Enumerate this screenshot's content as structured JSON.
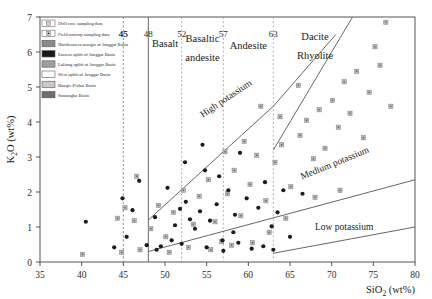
{
  "chart_data": {
    "type": "scatter",
    "title": "",
    "xlabel": "SiO2 (wt%)",
    "xlabel_main": "SiO",
    "xlabel_sub": "2",
    "xlabel_unit": " (wt%)",
    "ylabel": "K2O (wt%)",
    "ylabel_main": "K",
    "ylabel_sub": "2",
    "ylabel_main2": "O (wt%)",
    "xlim": [
      35,
      80
    ],
    "ylim": [
      0,
      7
    ],
    "xticks": [
      35,
      40,
      45,
      50,
      55,
      60,
      65,
      70,
      75,
      80
    ],
    "yticks": [
      0,
      1,
      2,
      3,
      4,
      5,
      6,
      7
    ],
    "grid": false,
    "legend_position": "top-left",
    "rock_boundaries": [
      45,
      48,
      52,
      57,
      63
    ],
    "rock_fields": [
      {
        "label": "Basalt",
        "x": 50.0,
        "y": 6.15
      },
      {
        "label": "Basaltic",
        "x": 54.5,
        "y": 6.3
      },
      {
        "label": "andesite",
        "x": 54.5,
        "y": 5.75
      },
      {
        "label": "Andesite",
        "x": 60.0,
        "y": 6.1
      },
      {
        "label": "Dacite",
        "x": 68.0,
        "y": 6.35
      },
      {
        "label": "Rhyolite",
        "x": 68.0,
        "y": 5.8
      }
    ],
    "series_labels": [
      {
        "label": "High potassium",
        "x": 57.5,
        "y": 4.6,
        "rotate": -34
      },
      {
        "label": "Medium potassium",
        "x": 70.5,
        "y": 2.75,
        "rotate": -22
      },
      {
        "label": "Low potassium",
        "x": 71.5,
        "y": 0.92,
        "rotate": 0
      }
    ],
    "boundary_lines": [
      {
        "name": "high-k-line",
        "points": [
          [
            48,
            1.2
          ],
          [
            63,
            4.45
          ],
          [
            70.5,
            6.5
          ]
        ]
      },
      {
        "name": "medium-k-line",
        "points": [
          [
            48,
            0.3
          ],
          [
            80,
            2.35
          ]
        ]
      },
      {
        "name": "low-k-line",
        "points": [
          [
            63,
            0.25
          ],
          [
            80,
            1.0
          ]
        ]
      },
      {
        "name": "dacite-rhyolite-div",
        "points": [
          [
            63,
            3.2
          ],
          [
            72.5,
            7.0
          ]
        ]
      },
      {
        "name": "left-field-edge",
        "points": [
          [
            48,
            0
          ],
          [
            48,
            7
          ]
        ]
      }
    ],
    "series": [
      {
        "name": "Drill core sampling data",
        "marker": "square-open-dot",
        "points": [
          [
            40.1,
            0.22
          ],
          [
            44.8,
            0.28
          ],
          [
            44.3,
            1.25
          ],
          [
            45.2,
            1.55
          ],
          [
            46.3,
            1.18
          ],
          [
            46.6,
            2.45
          ],
          [
            47.0,
            0.35
          ],
          [
            48.3,
            0.95
          ],
          [
            49.2,
            1.62
          ],
          [
            50.1,
            0.72
          ],
          [
            51.0,
            1.42
          ],
          [
            52.2,
            2.05
          ],
          [
            53.4,
            1.08
          ],
          [
            54.1,
            1.88
          ],
          [
            55.2,
            2.35
          ],
          [
            56.0,
            1.15
          ],
          [
            56.8,
            0.58
          ],
          [
            57.5,
            1.95
          ],
          [
            58.3,
            2.62
          ],
          [
            59.1,
            1.32
          ],
          [
            60.2,
            2.22
          ],
          [
            61.0,
            3.05
          ],
          [
            62.1,
            1.75
          ],
          [
            63.2,
            2.85
          ],
          [
            64.0,
            3.35
          ],
          [
            65.1,
            2.15
          ],
          [
            66.2,
            3.62
          ],
          [
            67.0,
            4.05
          ],
          [
            67.8,
            2.95
          ],
          [
            68.5,
            4.35
          ],
          [
            69.2,
            3.25
          ],
          [
            70.1,
            4.62
          ],
          [
            70.8,
            3.85
          ],
          [
            71.5,
            5.15
          ],
          [
            72.2,
            4.25
          ],
          [
            73.0,
            5.45
          ],
          [
            73.8,
            3.55
          ],
          [
            74.5,
            4.85
          ],
          [
            75.2,
            6.15
          ],
          [
            75.8,
            5.62
          ],
          [
            76.5,
            6.85
          ],
          [
            77.1,
            4.45
          ],
          [
            71.0,
            2.05
          ],
          [
            68.0,
            1.85
          ],
          [
            64.5,
            1.25
          ],
          [
            62.5,
            0.85
          ],
          [
            60.5,
            0.55
          ],
          [
            58.0,
            0.48
          ],
          [
            55.5,
            0.35
          ],
          [
            52.8,
            0.42
          ],
          [
            50.5,
            0.28
          ],
          [
            66.0,
            5.05
          ],
          [
            63.8,
            4.15
          ],
          [
            61.5,
            4.45
          ],
          [
            59.5,
            3.45
          ],
          [
            57.2,
            3.15
          ]
        ]
      },
      {
        "name": "Field outcrop sampling data",
        "marker": "circle-filled",
        "points": [
          [
            40.5,
            1.15
          ],
          [
            43.9,
            0.42
          ],
          [
            44.9,
            1.82
          ],
          [
            45.4,
            0.72
          ],
          [
            46.1,
            1.48
          ],
          [
            46.9,
            2.32
          ],
          [
            48.8,
            1.28
          ],
          [
            49.5,
            0.45
          ],
          [
            50.3,
            2.12
          ],
          [
            51.2,
            1.05
          ],
          [
            51.8,
            1.52
          ],
          [
            52.5,
            1.72
          ],
          [
            53.0,
            1.22
          ],
          [
            53.6,
            0.95
          ],
          [
            54.2,
            1.45
          ],
          [
            54.8,
            2.62
          ],
          [
            55.4,
            1.18
          ],
          [
            56.2,
            1.65
          ],
          [
            56.9,
            0.62
          ],
          [
            57.6,
            2.05
          ],
          [
            58.4,
            1.35
          ],
          [
            59.0,
            3.12
          ],
          [
            59.8,
            1.82
          ],
          [
            60.4,
            0.38
          ],
          [
            61.2,
            1.55
          ],
          [
            62.0,
            2.28
          ],
          [
            62.8,
            1.02
          ],
          [
            63.5,
            1.42
          ],
          [
            64.2,
            2.05
          ],
          [
            65.0,
            0.72
          ],
          [
            52.0,
            0.52
          ],
          [
            50.8,
            0.62
          ],
          [
            49.0,
            0.35
          ],
          [
            47.8,
            0.48
          ],
          [
            55.0,
            0.42
          ],
          [
            57.0,
            0.32
          ],
          [
            58.8,
            0.55
          ],
          [
            61.8,
            0.45
          ],
          [
            63.0,
            0.35
          ],
          [
            66.5,
            1.95
          ],
          [
            52.4,
            2.85
          ],
          [
            54.5,
            3.35
          ],
          [
            56.5,
            2.45
          ],
          [
            58.2,
            0.85
          ]
        ]
      }
    ]
  },
  "legend": {
    "items": [
      {
        "label": "Drill core sampling data",
        "swatch": "point-square-open"
      },
      {
        "label": "Field outcrop sampling data",
        "swatch": "point-square-dot"
      },
      {
        "label": "Northeastern margin of Junggar Basin",
        "swatch": "#8a8a8a"
      },
      {
        "label": "Eastern uplift of Junggar Basin",
        "swatch": "#1a1a1a"
      },
      {
        "label": "Luliang uplift of Junggar Basin",
        "swatch": "#9e9e9e"
      },
      {
        "label": "West uplift of Junggar Basin",
        "swatch": "#ffffff"
      },
      {
        "label": "Buoqie-Pishui Basin",
        "swatch": "#c9c9c9"
      },
      {
        "label": "Santanghu Basin",
        "swatch": "#6e6e6e"
      }
    ]
  }
}
